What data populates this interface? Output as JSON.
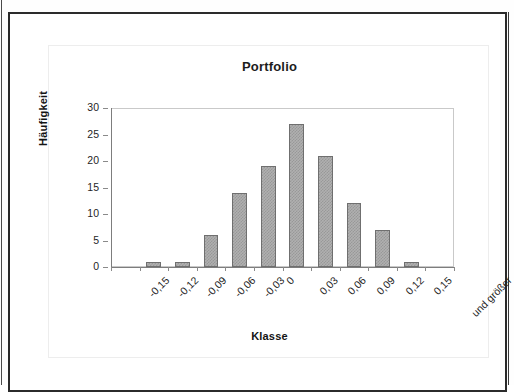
{
  "document": {
    "frame_color": "#2b2b2b",
    "background": "#ffffff"
  },
  "chart": {
    "title": "Portfolio",
    "x_axis_title": "Klasse",
    "y_axis_title": "Häufigkeit",
    "bar_color": "#b0b0b0",
    "bar_border_color": "#6f6f6f"
  },
  "chart_data": {
    "type": "bar",
    "title": "Portfolio",
    "xlabel": "Klasse",
    "ylabel": "Häufigkeit",
    "categories": [
      "-0,15",
      "-0,12",
      "-0,09",
      "-0,06",
      "-0,03",
      "0",
      "0,03",
      "0,06",
      "0,09",
      "0,12",
      "0,15",
      "und größer"
    ],
    "values": [
      0,
      1,
      1,
      6,
      14,
      19,
      27,
      21,
      12,
      7,
      1,
      0
    ],
    "ylim": [
      0,
      30
    ],
    "yticks": [
      0,
      5,
      10,
      15,
      20,
      25,
      30
    ],
    "ytick_labels": [
      "0",
      "5",
      "10",
      "15",
      "20",
      "25",
      "30"
    ],
    "grid": false,
    "legend": false,
    "xtick_rotation": -45
  }
}
